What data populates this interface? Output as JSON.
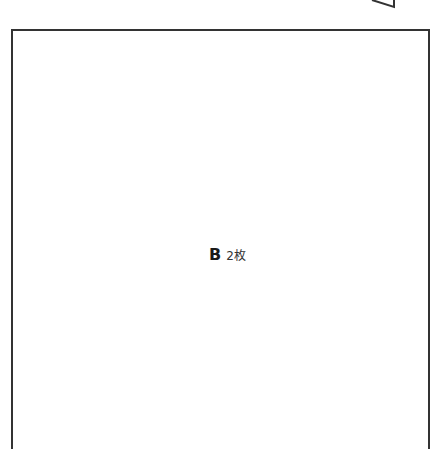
{
  "panel": {
    "letter": "B",
    "count": "2枚"
  },
  "colors": {
    "border": "#333333",
    "text": "#1a1a1a",
    "background": "#ffffff"
  }
}
